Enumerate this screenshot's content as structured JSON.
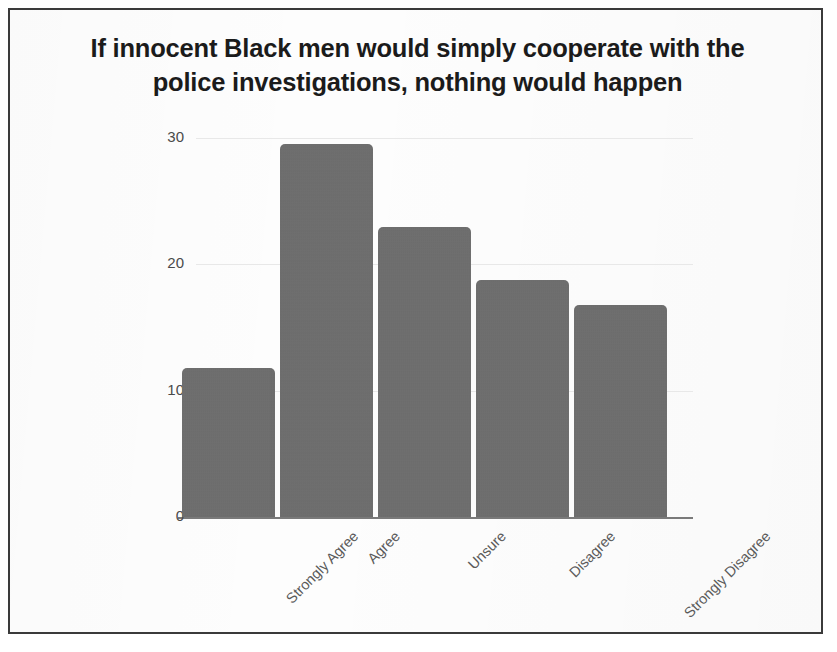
{
  "chart_data": {
    "type": "bar",
    "title": "If innocent Black men would simply cooperate with the police investigations, nothing would happen",
    "title_lines": [
      "If innocent Black men would simply cooperate with the",
      "police investigations, nothing would happen"
    ],
    "categories": [
      "Strongly Agree",
      "Agree",
      "Unsure",
      "Disagree",
      "Strongly Disagree"
    ],
    "values": [
      11.8,
      29.5,
      23.0,
      18.8,
      16.8
    ],
    "xlabel": "",
    "ylabel": "",
    "ylim": [
      0,
      31
    ],
    "yticks": [
      0,
      10,
      20,
      30
    ],
    "ytick_labels": [
      "0",
      "10",
      "20",
      "30"
    ],
    "grid": true,
    "legend": false,
    "legend_position": "none",
    "bar_color": "#6d6d6d",
    "gridline_color": "#e8e8e8",
    "axis_color": "#7a7a7a",
    "background_color": "#fdfdfd",
    "frame_color": "#3a3a3a",
    "xtick_rotation": -45
  }
}
